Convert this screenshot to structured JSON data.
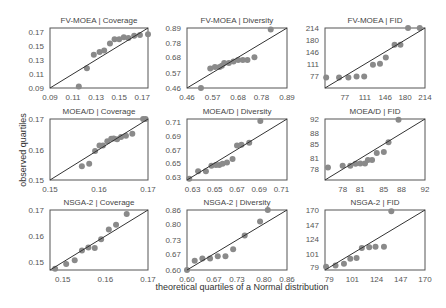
{
  "figure": {
    "xlabel": "theoretical quartiles of a Normal distribution",
    "ylabel": "observed quartiles"
  },
  "chart_data": [
    {
      "type": "scatter",
      "title": "FV-MOEA | Coverage",
      "xticks": [
        "0.09",
        "0.11",
        "0.13",
        "0.15",
        "0.17"
      ],
      "yticks": [
        "0.09",
        "0.11",
        "0.13",
        "0.15",
        "0.17"
      ],
      "range": [
        0.09,
        0.175
      ],
      "reference_line": true,
      "points": [
        [
          0.115,
          0.092
        ],
        [
          0.122,
          0.118
        ],
        [
          0.128,
          0.137
        ],
        [
          0.133,
          0.141
        ],
        [
          0.137,
          0.143
        ],
        [
          0.142,
          0.153
        ],
        [
          0.146,
          0.159
        ],
        [
          0.15,
          0.159
        ],
        [
          0.154,
          0.162
        ],
        [
          0.158,
          0.161
        ],
        [
          0.163,
          0.164
        ],
        [
          0.168,
          0.165
        ],
        [
          0.175,
          0.166
        ]
      ]
    },
    {
      "type": "scatter",
      "title": "FV-MOEA | Diversity",
      "xticks": [
        "0.46",
        "0.57",
        "0.68",
        "0.78",
        "0.89"
      ],
      "yticks": [
        "0.46",
        "0.57",
        "0.68",
        "0.78",
        "0.89"
      ],
      "range": [
        0.46,
        0.89
      ],
      "reference_line": true,
      "points": [
        [
          0.52,
          0.45
        ],
        [
          0.56,
          0.6
        ],
        [
          0.58,
          0.61
        ],
        [
          0.6,
          0.61
        ],
        [
          0.61,
          0.62
        ],
        [
          0.62,
          0.64
        ],
        [
          0.64,
          0.64
        ],
        [
          0.66,
          0.65
        ],
        [
          0.68,
          0.66
        ],
        [
          0.7,
          0.66
        ],
        [
          0.72,
          0.66
        ],
        [
          0.75,
          0.68
        ],
        [
          0.82,
          0.88
        ]
      ]
    },
    {
      "type": "scatter",
      "title": "FV-MOEA | FID",
      "xticks": [
        "77",
        "111",
        "146",
        "180",
        "214"
      ],
      "yticks": [
        "77",
        "111",
        "146",
        "180",
        "214"
      ],
      "range": [
        43,
        214
      ],
      "reference_line": true,
      "points": [
        [
          45,
          73
        ],
        [
          67,
          73
        ],
        [
          83,
          73
        ],
        [
          97,
          76
        ],
        [
          110,
          76
        ],
        [
          125,
          109
        ],
        [
          137,
          112
        ],
        [
          147,
          130
        ],
        [
          162,
          166
        ],
        [
          172,
          166
        ],
        [
          185,
          214
        ],
        [
          205,
          214
        ]
      ]
    },
    {
      "type": "scatter",
      "title": "MOEA/D | Coverage",
      "xticks": [
        "0.15",
        "0.16",
        "0.17"
      ],
      "yticks": [
        "0.15",
        "0.16",
        "0.17"
      ],
      "range": [
        0.15,
        0.17
      ],
      "reference_line": true,
      "points": [
        [
          0.1565,
          0.1545
        ],
        [
          0.158,
          0.1553
        ],
        [
          0.1592,
          0.1595
        ],
        [
          0.1601,
          0.1613
        ],
        [
          0.1608,
          0.1613
        ],
        [
          0.1617,
          0.1627
        ],
        [
          0.1625,
          0.1635
        ],
        [
          0.163,
          0.1636
        ],
        [
          0.1637,
          0.1634
        ],
        [
          0.1645,
          0.1641
        ],
        [
          0.1655,
          0.1645
        ],
        [
          0.1668,
          0.1652
        ],
        [
          0.169,
          0.17
        ],
        [
          0.1695,
          0.17
        ]
      ]
    },
    {
      "type": "scatter",
      "title": "MOEA/D | Diversity",
      "xticks": [
        "0.63",
        "0.65",
        "0.67",
        "0.69",
        "0.71"
      ],
      "yticks": [
        "0.63",
        "0.65",
        "0.67",
        "0.69",
        "0.71"
      ],
      "range": [
        0.625,
        0.715
      ],
      "reference_line": true,
      "points": [
        [
          0.627,
          0.627
        ],
        [
          0.635,
          0.638
        ],
        [
          0.642,
          0.638
        ],
        [
          0.647,
          0.646
        ],
        [
          0.651,
          0.647
        ],
        [
          0.654,
          0.647
        ],
        [
          0.657,
          0.649
        ],
        [
          0.661,
          0.651
        ],
        [
          0.666,
          0.656
        ],
        [
          0.67,
          0.676
        ],
        [
          0.674,
          0.677
        ],
        [
          0.681,
          0.68
        ],
        [
          0.691,
          0.712
        ]
      ]
    },
    {
      "type": "scatter",
      "title": "MOEA/D | FID",
      "xticks": [
        "78",
        "81",
        "85",
        "88",
        "92"
      ],
      "yticks": [
        "78",
        "81",
        "85",
        "88",
        "92"
      ],
      "range": [
        75,
        92
      ],
      "reference_line": true,
      "points": [
        [
          75.5,
          78.5
        ],
        [
          78.0,
          79.0
        ],
        [
          79.3,
          79.0
        ],
        [
          80.2,
          79.5
        ],
        [
          81.0,
          79.6
        ],
        [
          81.8,
          79.6
        ],
        [
          82.3,
          80.6
        ],
        [
          83.0,
          80.6
        ],
        [
          83.8,
          82.5
        ],
        [
          85.0,
          82.8
        ],
        [
          85.8,
          85.5
        ],
        [
          87.5,
          91.8
        ]
      ]
    },
    {
      "type": "scatter",
      "title": "NSGA-2 | Coverage",
      "xticks": [
        "0.15",
        "0.16",
        "0.17"
      ],
      "yticks": [
        "0.15",
        "0.16",
        "0.17"
      ],
      "range": [
        0.147,
        0.17
      ],
      "reference_line": true,
      "points": [
        [
          0.1482,
          0.1475
        ],
        [
          0.1508,
          0.1493
        ],
        [
          0.1528,
          0.1507
        ],
        [
          0.1545,
          0.1545
        ],
        [
          0.156,
          0.1556
        ],
        [
          0.1575,
          0.1554
        ],
        [
          0.159,
          0.1588
        ],
        [
          0.1608,
          0.1625
        ],
        [
          0.1625,
          0.1643
        ],
        [
          0.165,
          0.1685
        ]
      ]
    },
    {
      "type": "scatter",
      "title": "NSGA-2 | Diversity",
      "xticks": [
        "0.60",
        "0.67",
        "0.73",
        "0.80",
        "0.86"
      ],
      "yticks": [
        "0.60",
        "0.67",
        "0.73",
        "0.80",
        "0.86"
      ],
      "range": [
        0.6,
        0.86
      ],
      "reference_line": true,
      "points": [
        [
          0.6,
          0.6
        ],
        [
          0.62,
          0.64
        ],
        [
          0.64,
          0.65
        ],
        [
          0.66,
          0.65
        ],
        [
          0.68,
          0.66
        ],
        [
          0.7,
          0.66
        ],
        [
          0.72,
          0.69
        ],
        [
          0.75,
          0.75
        ],
        [
          0.79,
          0.81
        ],
        [
          0.81,
          0.86
        ]
      ]
    },
    {
      "type": "scatter",
      "title": "NSGA-2 | FID",
      "xticks": [
        "79",
        "101",
        "124",
        "147",
        "170"
      ],
      "yticks": [
        "79",
        "101",
        "124",
        "147",
        "170"
      ],
      "range": [
        75,
        170
      ],
      "reference_line": true,
      "points": [
        [
          76,
          80
        ],
        [
          85,
          82
        ],
        [
          93,
          85
        ],
        [
          99,
          93
        ],
        [
          105,
          94
        ],
        [
          110,
          110
        ],
        [
          117,
          111
        ],
        [
          123,
          112
        ],
        [
          131,
          112
        ],
        [
          138,
          168
        ]
      ]
    }
  ]
}
